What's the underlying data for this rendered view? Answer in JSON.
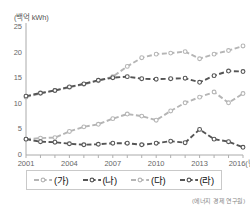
{
  "chart_data": {
    "type": "line",
    "title": "",
    "subtitle": "",
    "unit_label": "(백억 kWh)",
    "xlabel": "",
    "ylabel": "",
    "x": [
      2001,
      2002,
      2003,
      2004,
      2005,
      2006,
      2007,
      2008,
      2009,
      2010,
      2011,
      2012,
      2013,
      2014,
      2015,
      2016
    ],
    "x_tick_labels": [
      "2001",
      "2004",
      "2007",
      "2010",
      "2013",
      "2016(년)"
    ],
    "x_tick_values": [
      2001,
      2004,
      2007,
      2010,
      2013,
      2016
    ],
    "y_tick_labels": [
      "0",
      "5",
      "10",
      "15",
      "20",
      "25"
    ],
    "y_tick_values": [
      0,
      5,
      10,
      15,
      20,
      25
    ],
    "ylim": [
      0,
      25
    ],
    "xlim": [
      2001,
      2016
    ],
    "grid": false,
    "legend_position": "bottom",
    "series": [
      {
        "name": "(가)",
        "color": "#b5b5b5",
        "marker": "open-circle",
        "dash": "dashed",
        "values": [
          11.3,
          12.0,
          12.6,
          13.2,
          13.8,
          14.5,
          15.3,
          17.3,
          19.0,
          19.7,
          19.9,
          20.2,
          18.8,
          19.7,
          20.4,
          21.3
        ]
      },
      {
        "name": "(나)",
        "color": "#555555",
        "marker": "open-circle",
        "dash": "dashed",
        "values": [
          11.5,
          12.1,
          12.6,
          13.3,
          13.9,
          14.6,
          15.1,
          15.3,
          14.9,
          14.8,
          14.9,
          15.0,
          14.2,
          15.5,
          16.4,
          16.3
        ]
      },
      {
        "name": "(다)",
        "color": "#b5b5b5",
        "marker": "open-circle",
        "dash": "dashed",
        "values": [
          3.1,
          3.3,
          3.4,
          4.6,
          5.5,
          6.0,
          7.1,
          8.0,
          7.6,
          6.8,
          8.6,
          10.2,
          11.3,
          12.3,
          10.2,
          12.0
        ]
      },
      {
        "name": "(라)",
        "color": "#555555",
        "marker": "open-circle",
        "dash": "dashed",
        "values": [
          3.1,
          2.6,
          2.5,
          2.2,
          2.0,
          2.1,
          2.3,
          2.3,
          2.0,
          2.3,
          2.7,
          2.4,
          5.0,
          3.1,
          2.6,
          3.2
        ]
      }
    ],
    "series_extra": {
      "ra_last_point": 1.5
    }
  },
  "legend": {
    "items": [
      {
        "label": "(가)"
      },
      {
        "label": "(나)"
      },
      {
        "label": "(다)"
      },
      {
        "label": "(라)"
      }
    ]
  },
  "source": {
    "note": "(에너지 경제 연구원)"
  }
}
